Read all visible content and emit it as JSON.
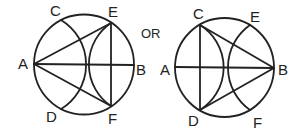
{
  "figure": {
    "separator_label": "OR",
    "left": {
      "labels": {
        "A": "A",
        "B": "B",
        "C": "C",
        "D": "D",
        "E": "E",
        "F": "F"
      },
      "description": "Circle with diameter AB, arcs through C-D and E-F, triangle AEF"
    },
    "right": {
      "labels": {
        "A": "A",
        "B": "B",
        "C": "C",
        "D": "D",
        "E": "E",
        "F": "F"
      },
      "description": "Circle with diameter AB, arcs through C-D and E-F, triangle BCD"
    },
    "colors": {
      "stroke": "#222222",
      "background": "#ffffff"
    }
  }
}
